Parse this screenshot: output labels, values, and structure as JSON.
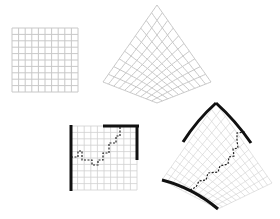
{
  "figure": {
    "panels": [
      {
        "id": "square-grid",
        "cells": 10
      },
      {
        "id": "curved-grid",
        "cells": 10
      },
      {
        "id": "square-grid-path",
        "cells": 10,
        "boundary": [
          "left",
          "top-right-half",
          "right-top-half"
        ],
        "path": "dashed-staircase"
      },
      {
        "id": "curved-grid-path",
        "cells": 10,
        "boundary": [
          "top-left",
          "top-right",
          "bottom-left"
        ],
        "path": "dashed-staircase"
      }
    ],
    "colors": {
      "grid": "#c8c8c8",
      "boundary": "#111111",
      "path": "#222222"
    }
  }
}
